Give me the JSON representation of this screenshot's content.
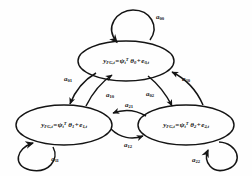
{
  "diagram": {
    "type": "markov-chain-state-diagram",
    "title": "",
    "stroke_color": "#141414",
    "background_color": "#fefefe",
    "states": [
      {
        "id": "state-0",
        "name": "state-top",
        "equation_plain": "y_FG,t = psi_t^T theta_0 + e_0,t",
        "output_var": "y",
        "output_sub": "FG,t",
        "equals": "=",
        "regressor_var": "ψ",
        "regressor_sub": "t",
        "regressor_sup": "T",
        "param_var": "θ",
        "param_sub": "0",
        "plus": "+",
        "noise_var": "e",
        "noise_sub": "0,t",
        "cx": 126,
        "cy": 61,
        "rx": 48,
        "ry": 20
      },
      {
        "id": "state-1",
        "name": "state-left",
        "equation_plain": "y_FG,t = psi_t^T theta_1 + e_1,t",
        "output_var": "y",
        "output_sub": "FG,t",
        "equals": "=",
        "regressor_var": "ψ",
        "regressor_sub": "t",
        "regressor_sup": "T",
        "param_var": "θ",
        "param_sub": "1",
        "plus": "+",
        "noise_var": "e",
        "noise_sub": "1,t",
        "cx": 64,
        "cy": 125,
        "rx": 48,
        "ry": 20
      },
      {
        "id": "state-2",
        "name": "state-right",
        "equation_plain": "y_FG,t = psi_t^T theta_2 + e_2,t",
        "output_var": "y",
        "output_sub": "FG,t",
        "equals": "=",
        "regressor_var": "ψ",
        "regressor_sub": "t",
        "regressor_sup": "T",
        "param_var": "θ",
        "param_sub": "2",
        "plus": "+",
        "noise_var": "e",
        "noise_sub": "2,t",
        "cx": 186,
        "cy": 125,
        "rx": 48,
        "ry": 20
      }
    ],
    "transitions": [
      {
        "id": "a00",
        "name": "self-loop-state-0",
        "var": "a",
        "sub": "00",
        "from": "state-0",
        "to": "state-0",
        "lx": 160,
        "ly": 17
      },
      {
        "id": "a01",
        "name": "transition-0-to-1",
        "var": "a",
        "sub": "01",
        "from": "state-0",
        "to": "state-1",
        "lx": 68,
        "ly": 79
      },
      {
        "id": "a10",
        "name": "transition-1-to-0",
        "var": "a",
        "sub": "10",
        "from": "state-1",
        "to": "state-0",
        "lx": 110,
        "ly": 95
      },
      {
        "id": "a20",
        "name": "transition-2-to-0",
        "var": "a",
        "sub": "20",
        "from": "state-2",
        "to": "state-0",
        "lx": 186,
        "ly": 79
      },
      {
        "id": "a02",
        "name": "transition-0-to-2",
        "var": "a",
        "sub": "02",
        "from": "state-0",
        "to": "state-2",
        "lx": 150,
        "ly": 94
      },
      {
        "id": "a21",
        "name": "transition-2-to-1",
        "var": "a",
        "sub": "21",
        "from": "state-2",
        "to": "state-1",
        "lx": 129,
        "ly": 105
      },
      {
        "id": "a12",
        "name": "transition-1-to-2",
        "var": "a",
        "sub": "12",
        "from": "state-1",
        "to": "state-2",
        "lx": 128,
        "ly": 145
      },
      {
        "id": "a11",
        "name": "self-loop-state-1",
        "var": "a",
        "sub": "11",
        "from": "state-1",
        "to": "state-1",
        "lx": 55,
        "ly": 159
      },
      {
        "id": "a22",
        "name": "self-loop-state-2",
        "var": "a",
        "sub": "22",
        "from": "state-2",
        "to": "state-2",
        "lx": 196,
        "ly": 160
      }
    ]
  }
}
